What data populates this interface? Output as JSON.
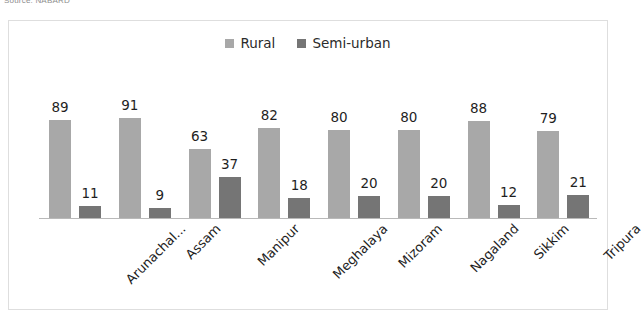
{
  "source_caption": "Source: NABARD",
  "colors": {
    "rural": "#a8a8a8",
    "semi_urban": "#757575",
    "axis": "#b9b9b9",
    "frame": "#dedede",
    "label_text": "#1f1f1f"
  },
  "chart_data": {
    "type": "bar",
    "title": "",
    "subtitle": "",
    "xlabel": "",
    "ylabel": "",
    "grid": false,
    "legend_position": "top-center",
    "ylim": [
      0,
      100
    ],
    "categories": [
      "Arunachal...",
      "Assam",
      "Manipur",
      "Meghalaya",
      "Mizoram",
      "Nagaland",
      "Sikkim",
      "Tripura"
    ],
    "series": [
      {
        "name": "Rural",
        "color": "#a8a8a8",
        "values": [
          89,
          91,
          63,
          82,
          80,
          80,
          88,
          79
        ]
      },
      {
        "name": "Semi-urban",
        "color": "#757575",
        "values": [
          11,
          9,
          37,
          18,
          20,
          20,
          12,
          21
        ]
      }
    ]
  }
}
